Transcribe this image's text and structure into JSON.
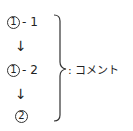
{
  "diagram": {
    "steps": [
      {
        "number": "1",
        "suffix": "- 1"
      },
      {
        "number": "1",
        "suffix": "- 2"
      },
      {
        "number": "2",
        "suffix": ""
      }
    ],
    "arrow": "↓",
    "comment_label": ": コメント"
  }
}
